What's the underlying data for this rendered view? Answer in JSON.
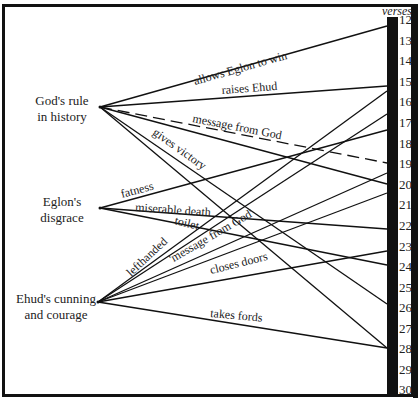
{
  "header": {
    "verses_label": "verses"
  },
  "categories": [
    {
      "id": "gods-rule",
      "line1": "God's rule",
      "line2": "in history",
      "hub": [
        100,
        107
      ]
    },
    {
      "id": "eglons-disgrace",
      "line1": "Eglon's",
      "line2": "disgrace",
      "hub": [
        100,
        208
      ]
    },
    {
      "id": "ehuds-cunning",
      "line1": "Ehud's cunning",
      "line2": "and courage",
      "hub": [
        98,
        302
      ]
    }
  ],
  "verses": [
    "12",
    "13",
    "14",
    "15",
    "16",
    "17",
    "18",
    "19",
    "20",
    "21",
    "22",
    "23",
    "24",
    "25",
    "26",
    "27",
    "28",
    "29",
    "30"
  ],
  "connections": [
    {
      "from": "gods-rule",
      "verse": 12,
      "label": "allows Eglon to win",
      "dashed": false
    },
    {
      "from": "gods-rule",
      "verse": 15,
      "label": "raises Ehud",
      "dashed": false
    },
    {
      "from": "gods-rule",
      "verse": 19,
      "label": "message from God",
      "dashed": true
    },
    {
      "from": "gods-rule",
      "verse": 20,
      "label": "",
      "dashed": false
    },
    {
      "from": "gods-rule",
      "verse": 26,
      "label": "gives victory",
      "dashed": false
    },
    {
      "from": "gods-rule",
      "verse": 28,
      "label": "",
      "dashed": false
    },
    {
      "from": "eglons-disgrace",
      "verse": 18,
      "label": "fatness",
      "dashed": false
    },
    {
      "from": "eglons-disgrace",
      "verse": 22,
      "label": "miserable death",
      "dashed": false
    },
    {
      "from": "eglons-disgrace",
      "verse": 24,
      "label": "toilet",
      "dashed": false
    },
    {
      "from": "ehuds-cunning",
      "verse": 15,
      "label": "lefthanded",
      "dashed": false
    },
    {
      "from": "ehuds-cunning",
      "verse": 17,
      "label": "",
      "dashed": false
    },
    {
      "from": "ehuds-cunning",
      "verse": 20,
      "label": "'message from God'",
      "dashed": false
    },
    {
      "from": "ehuds-cunning",
      "verse": 21,
      "label": "",
      "dashed": false
    },
    {
      "from": "ehuds-cunning",
      "verse": 23,
      "label": "closes doors",
      "dashed": false
    },
    {
      "from": "ehuds-cunning",
      "verse": 28,
      "label": "takes fords",
      "dashed": false
    }
  ],
  "labels": {
    "allows_eglon": "allows Eglon to win",
    "raises_ehud": "raises Ehud",
    "message_from_god": "message from God",
    "gives_victory": "gives victory",
    "fatness": "fatness",
    "miserable_death": "miserable death",
    "toilet": "toilet",
    "lefthanded": "lefthanded",
    "message_from_god_quoted": "'message from God'",
    "closes_doors": "closes doors",
    "takes_fords": "takes fords"
  },
  "colors": {
    "ink": "#111111",
    "paper": "#ffffff"
  }
}
